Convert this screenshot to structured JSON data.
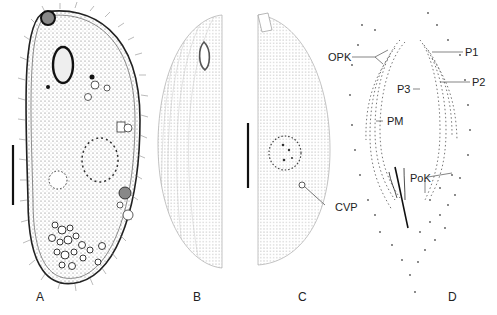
{
  "figure": {
    "panels": [
      {
        "id": "A",
        "label": "A",
        "description": "live ciliate cell with cilia, macronucleus, vacuoles and food inclusions"
      },
      {
        "id": "B",
        "label": "B",
        "description": "silver-stained infraciliature, ventral side with oral apparatus"
      },
      {
        "id": "C",
        "label": "C",
        "description": "silver-stained infraciliature, dorsal side with nucleus and contractile vacuole pore"
      },
      {
        "id": "D",
        "label": "D",
        "description": "oral apparatus detail of kineties"
      }
    ],
    "annotations": {
      "opk": "OPK",
      "p1": "P1",
      "p2": "P2",
      "p3": "P3",
      "pm": "PM",
      "pok": "PoK",
      "cvp": "CVP"
    },
    "scale_bars": [
      {
        "panel": "A"
      },
      {
        "panel": "B-C"
      }
    ],
    "colors": {
      "ink": "#222222",
      "stipple": "#555555",
      "background": "#ffffff"
    }
  }
}
